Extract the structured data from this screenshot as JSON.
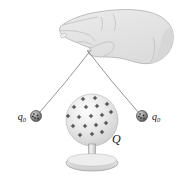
{
  "figure": {
    "labels": {
      "left_charge": {
        "base": "q",
        "sub": "0"
      },
      "right_charge": {
        "base": "q",
        "sub": "0"
      },
      "central_charge": "Q"
    },
    "plus_symbol": "+",
    "colors": {
      "background": "#ffffff",
      "hand_fill": "#e6e6e6",
      "hand_shade": "#d2d2d2",
      "hand_outline": "#a6a6a6",
      "hand_crease": "#b4b4b4",
      "nail_fill": "#f0f0f0",
      "string": "#8a8a8a",
      "sphere_outline": "#a8a8a8",
      "sphere_plus": "#1a1a1a",
      "ball_outline": "#2e2e2e",
      "ball_plus": "#1f1f1f",
      "stand_outline": "#979797",
      "label_color": "#111111"
    },
    "geometry": {
      "sphere_center": [
        92,
        120
      ],
      "sphere_radius": 26,
      "ball_radius": 5.5,
      "ball_centers": [
        [
          36,
          116
        ],
        [
          142,
          116
        ]
      ],
      "sphere_plus_offsets": [
        [
          -9,
          -21
        ],
        [
          3,
          -22
        ],
        [
          -18,
          -13
        ],
        [
          -6,
          -13
        ],
        [
          5,
          -14
        ],
        [
          15,
          -16
        ],
        [
          -24,
          -4
        ],
        [
          -13,
          -3
        ],
        [
          -1,
          -4
        ],
        [
          10,
          -5
        ],
        [
          19,
          -8
        ],
        [
          -19,
          6
        ],
        [
          -7,
          6
        ],
        [
          4,
          5
        ],
        [
          14,
          3
        ],
        [
          -12,
          15
        ],
        [
          0,
          14
        ],
        [
          10,
          12
        ]
      ],
      "ball_plus_offsets": [
        [
          -2,
          -2
        ],
        [
          1.5,
          -0.5
        ],
        [
          -1,
          2
        ],
        [
          2,
          2.5
        ],
        [
          -3,
          0.5
        ]
      ]
    }
  }
}
